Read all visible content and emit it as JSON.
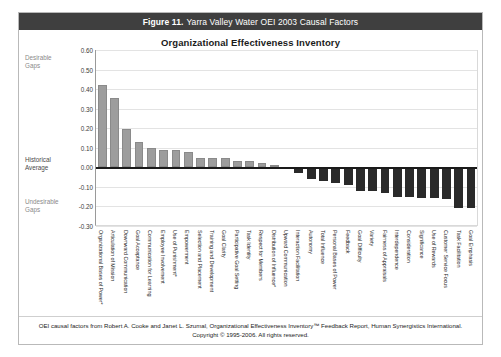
{
  "figure": {
    "number": "Figure 11.",
    "caption": "Yarra Valley Water OEI 2003 Causal Factors"
  },
  "chart_title": "Organizational Effectiveness Inventory",
  "annotations": {
    "desirable_gaps": "Desirable\nGaps",
    "desirable_gaps_line1": "Desirable",
    "desirable_gaps_line2": "Gaps",
    "historical_average_line1": "Historical",
    "historical_average_line2": "Average",
    "undesirable_gaps_line1": "Undesirable",
    "undesirable_gaps_line2": "Gaps"
  },
  "colors": {
    "titlebar_bg": "#3f3f3f",
    "positive_bar": "#9d9d9d",
    "negative_bar": "#2a2a2a",
    "gridline": "#e3e3e3",
    "zero_line": "#1a1a1a"
  },
  "footer": {
    "line1": "OEI causal factors from Robert A. Cooke and Janet L. Szumal, Organizational Effectiveness Inventory™ Feedback Report, Human Synergistics International.",
    "line2": "Copyright © 1995-2006. All rights reserved."
  },
  "chart_data": {
    "type": "bar",
    "title": "Organizational Effectiveness Inventory",
    "xlabel": "",
    "ylabel": "",
    "ylim": [
      -0.3,
      0.6
    ],
    "ytick_labels": [
      "0.60",
      "0.50",
      "0.40",
      "0.30",
      "0.20",
      "0.10",
      "0.00",
      "-0.10",
      "-0.20",
      "-0.30"
    ],
    "ytick_values": [
      0.6,
      0.5,
      0.4,
      0.3,
      0.2,
      0.1,
      0.0,
      -0.1,
      -0.2,
      -0.3
    ],
    "grid": true,
    "legend": "none",
    "categories": [
      "Organizational Bases of Power*",
      "Articulation of Mission",
      "Downward Communication",
      "Goal Acceptance",
      "Communication for Learning",
      "Employee Involvement",
      "Use of Punishment*",
      "Empowerment",
      "Selection and Placement",
      "Training and Development",
      "Goal Clarity",
      "Participative Goal Setting",
      "Task Identity",
      "Respect for Members",
      "Distribution of Influence*",
      "Upward Communication",
      "Interaction Facilitation",
      "Autonomy",
      "Total Influence",
      "Personal Bases of Power",
      "Feedback",
      "Goal Difficulty",
      "Variety",
      "Fairness of Appraisals",
      "Interdependence",
      "Consideration",
      "Significance",
      "Use of Rewards",
      "Customer Service Focus",
      "Task Facilitation",
      "Goal Emphasis"
    ],
    "values": [
      0.42,
      0.355,
      0.195,
      0.13,
      0.1,
      0.09,
      0.09,
      0.08,
      0.05,
      0.05,
      0.05,
      0.03,
      0.03,
      0.02,
      0.01,
      0.0,
      -0.03,
      -0.06,
      -0.07,
      -0.08,
      -0.09,
      -0.12,
      -0.12,
      -0.13,
      -0.15,
      -0.15,
      -0.155,
      -0.155,
      -0.16,
      -0.21,
      -0.21
    ]
  }
}
